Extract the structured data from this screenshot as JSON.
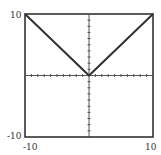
{
  "chart_data": {
    "type": "line",
    "title": "",
    "xlabel": "",
    "ylabel": "",
    "function": "y = |x|",
    "xlim": [
      -10,
      10
    ],
    "ylim": [
      -10,
      10
    ],
    "grid": false,
    "axes_ticks_every": 1,
    "series": [
      {
        "name": "y=|x|",
        "x": [
          -10,
          0,
          10
        ],
        "y": [
          10,
          0,
          10
        ]
      }
    ],
    "tick_labels": {
      "y_top": "10",
      "y_bottom": "-10",
      "x_left": "-10",
      "x_right": "10"
    }
  },
  "colors": {
    "line": "#333333",
    "frame": "#333333",
    "axis": "#444444"
  }
}
